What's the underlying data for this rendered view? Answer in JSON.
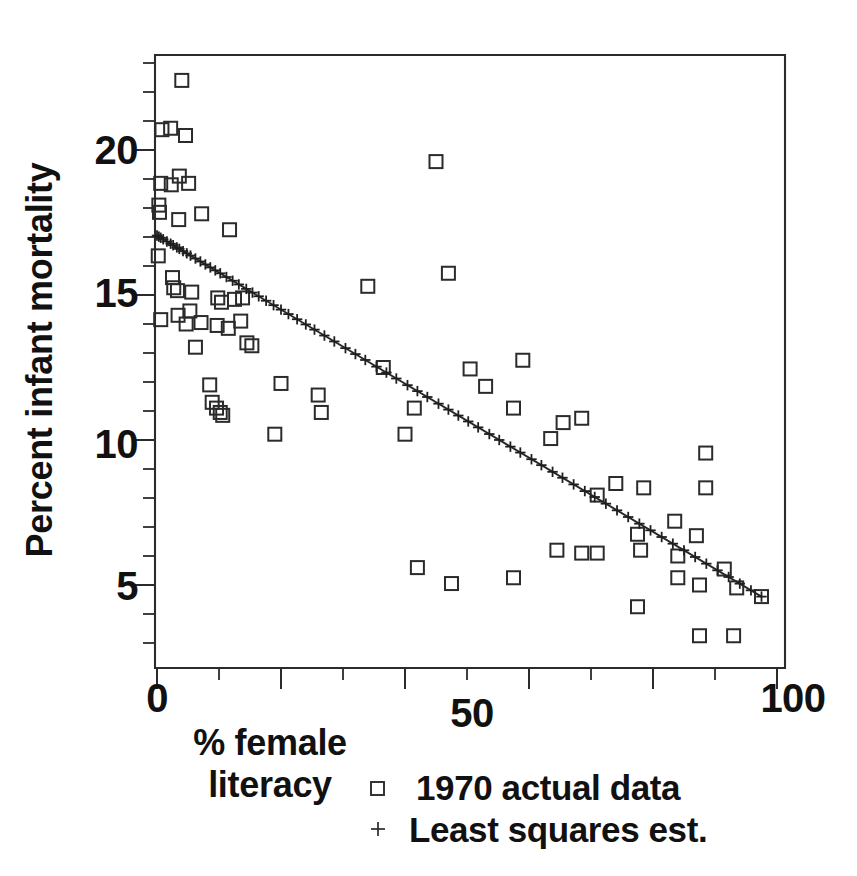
{
  "chart_data": {
    "type": "scatter",
    "title": "",
    "subtitle": "",
    "xlabel": "% female literacy",
    "ylabel": "Percent infant mortality",
    "xlim": [
      -2,
      101
    ],
    "ylim": [
      2.2,
      23.2
    ],
    "grid": false,
    "x_ticks_major": [
      0,
      50,
      100
    ],
    "x_tick_labels": [
      "0",
      "50",
      "100"
    ],
    "x_ticks_all": [
      0,
      10,
      20,
      30,
      40,
      50,
      60,
      70,
      80,
      90,
      100
    ],
    "y_ticks_major": [
      5,
      10,
      15,
      20
    ],
    "y_tick_labels": [
      "5",
      "10",
      "15",
      "20"
    ],
    "y_ticks_all": [
      3,
      4,
      5,
      6,
      7,
      8,
      9,
      10,
      11,
      12,
      13,
      14,
      15,
      16,
      17,
      18,
      19,
      20,
      21,
      22,
      23
    ],
    "legend_position": "below-axes",
    "marker_color": "#2b2b2b",
    "line_color": "#262626",
    "series": [
      {
        "name": "1970 actual data",
        "marker": "square",
        "points": [
          [
            4.0,
            22.4
          ],
          [
            0.8,
            20.7
          ],
          [
            2.2,
            20.75
          ],
          [
            4.6,
            20.5
          ],
          [
            0.6,
            18.85
          ],
          [
            2.3,
            18.8
          ],
          [
            3.6,
            19.1
          ],
          [
            5.1,
            18.85
          ],
          [
            0.3,
            18.1
          ],
          [
            0.4,
            17.85
          ],
          [
            3.5,
            17.6
          ],
          [
            7.2,
            17.8
          ],
          [
            11.7,
            17.25
          ],
          [
            0.2,
            16.35
          ],
          [
            2.5,
            15.6
          ],
          [
            2.7,
            15.25
          ],
          [
            3.3,
            15.15
          ],
          [
            5.6,
            15.1
          ],
          [
            9.8,
            14.9
          ],
          [
            10.4,
            14.75
          ],
          [
            12.5,
            14.85
          ],
          [
            13.8,
            14.9
          ],
          [
            0.6,
            14.15
          ],
          [
            3.4,
            14.3
          ],
          [
            4.7,
            14.0
          ],
          [
            5.3,
            14.45
          ],
          [
            7.1,
            14.05
          ],
          [
            9.7,
            13.95
          ],
          [
            11.5,
            13.85
          ],
          [
            13.5,
            14.1
          ],
          [
            6.2,
            13.2
          ],
          [
            14.5,
            13.35
          ],
          [
            15.3,
            13.25
          ],
          [
            34.0,
            15.3
          ],
          [
            45.0,
            19.6
          ],
          [
            47.0,
            15.75
          ],
          [
            8.5,
            11.9
          ],
          [
            8.9,
            11.3
          ],
          [
            9.6,
            11.1
          ],
          [
            10.2,
            10.95
          ],
          [
            10.6,
            10.85
          ],
          [
            20.0,
            11.95
          ],
          [
            19.0,
            10.2
          ],
          [
            26.0,
            11.55
          ],
          [
            26.5,
            10.95
          ],
          [
            36.5,
            12.5
          ],
          [
            41.5,
            11.1
          ],
          [
            40.0,
            10.2
          ],
          [
            50.5,
            12.45
          ],
          [
            53.0,
            11.85
          ],
          [
            59.0,
            12.75
          ],
          [
            57.5,
            11.1
          ],
          [
            63.5,
            10.05
          ],
          [
            65.5,
            10.6
          ],
          [
            68.5,
            10.75
          ],
          [
            42.0,
            5.6
          ],
          [
            47.5,
            5.05
          ],
          [
            57.5,
            5.25
          ],
          [
            64.5,
            6.2
          ],
          [
            68.5,
            6.1
          ],
          [
            71.0,
            6.1
          ],
          [
            71.0,
            8.1
          ],
          [
            74.0,
            8.5
          ],
          [
            78.5,
            8.35
          ],
          [
            77.5,
            6.75
          ],
          [
            78.0,
            6.2
          ],
          [
            83.5,
            7.2
          ],
          [
            84.0,
            6.0
          ],
          [
            84.0,
            5.25
          ],
          [
            77.5,
            4.25
          ],
          [
            88.5,
            9.55
          ],
          [
            88.5,
            8.35
          ],
          [
            87.0,
            6.7
          ],
          [
            87.5,
            5.0
          ],
          [
            91.5,
            5.55
          ],
          [
            93.5,
            4.9
          ],
          [
            97.5,
            4.6
          ],
          [
            87.5,
            3.25
          ],
          [
            93.0,
            3.25
          ]
        ]
      },
      {
        "name": "Least squares est.",
        "marker": "plus",
        "line": true,
        "fit_x_range": [
          0.0,
          97.5
        ],
        "fit_y_range": [
          17.05,
          4.6
        ],
        "slope": -0.1277,
        "intercept": 17.05,
        "points_x": [
          0.0,
          0.3,
          0.6,
          1.0,
          1.6,
          2.2,
          2.6,
          3.2,
          3.6,
          4.2,
          4.8,
          5.4,
          6.2,
          7.0,
          7.8,
          8.6,
          9.4,
          10.2,
          11.2,
          12.2,
          13.2,
          14.4,
          15.4,
          16.4,
          17.6,
          18.8,
          20.0,
          21.2,
          22.6,
          24.0,
          25.4,
          27.0,
          28.6,
          30.4,
          32.0,
          33.6,
          35.4,
          37.0,
          38.6,
          40.4,
          42.0,
          43.6,
          45.4,
          47.0,
          48.6,
          50.2,
          51.8,
          53.6,
          55.2,
          57.0,
          58.6,
          60.4,
          62.0,
          63.8,
          65.4,
          67.2,
          69.0,
          70.6,
          72.4,
          74.2,
          76.0,
          77.8,
          79.6,
          81.4,
          83.2,
          85.0,
          86.8,
          88.6,
          90.4,
          92.2,
          94.0,
          95.8,
          97.5
        ]
      }
    ]
  },
  "axis": {
    "x_label_line1": "% female literacy",
    "x_label_word1": "% female",
    "x_label_word2": "literacy",
    "y_label": "Percent infant mortality",
    "x_tick_0": "0",
    "x_tick_50": "50",
    "x_tick_100": "100",
    "y_tick_5": "5",
    "y_tick_10": "10",
    "y_tick_15": "15",
    "y_tick_20": "20"
  },
  "legend": {
    "entry1_label": "1970 actual data",
    "entry1_marker": "square-marker-icon",
    "entry2_label": "Least squares est.",
    "entry2_marker": "plus-marker-icon"
  },
  "colors": {
    "ink": "#2b2b2b",
    "background": "#ffffff",
    "text": "#111111"
  }
}
